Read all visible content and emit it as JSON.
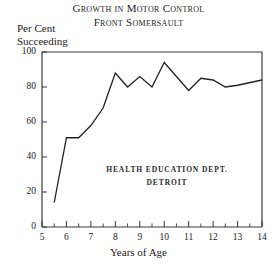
{
  "title": {
    "line1": "Growth in Motor Control",
    "line2": "Front Somersault"
  },
  "inner_caption": {
    "line1": "HEALTH EDUCATION DEPT.",
    "line2": "DETROIT"
  },
  "axes": {
    "ylabel_line1": "Per Cent",
    "ylabel_line2": "Succeeding",
    "xlabel": "Years of Age"
  },
  "chart_data": {
    "type": "line",
    "subtitle": "Front Somersault",
    "xlabel": "Years of Age",
    "ylabel": "Per Cent Succeeding",
    "xlim": [
      5,
      14
    ],
    "ylim": [
      0,
      100
    ],
    "xticks": [
      5,
      6,
      7,
      8,
      9,
      10,
      11,
      12,
      13,
      14
    ],
    "xtick_labels": [
      "5",
      "6",
      "7",
      "8",
      "9",
      "10",
      "11",
      "12",
      "13",
      "14"
    ],
    "yticks": [
      0,
      20,
      40,
      60,
      80,
      100
    ],
    "ytick_labels": [
      "0",
      "20",
      "40",
      "60",
      "80",
      "100"
    ],
    "minor_xticks_interval": 0.5,
    "grid": false,
    "legend": "none",
    "annotations": [
      "HEALTH EDUCATION DEPT.",
      "DETROIT"
    ],
    "series": [
      {
        "name": "Per Cent Succeeding",
        "color": "#222222",
        "x": [
          5.5,
          6.0,
          6.5,
          7.0,
          7.5,
          8.0,
          8.5,
          9.0,
          9.5,
          10.0,
          10.5,
          11.0,
          11.5,
          12.0,
          12.5,
          13.0,
          14.0
        ],
        "values": [
          14,
          51,
          51,
          58,
          68,
          88,
          80,
          86,
          80,
          94,
          86,
          78,
          85,
          84,
          80,
          81,
          84
        ]
      }
    ]
  }
}
